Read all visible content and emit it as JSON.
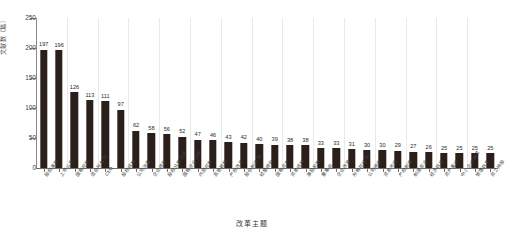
{
  "header": {
    "clipped_line_left": "",
    "clipped_line_right": ""
  },
  "chart_data": {
    "type": "bar",
    "title": "",
    "xlabel": "改革主题",
    "ylabel": "文献数（篇）",
    "ylim": [
      0,
      250
    ],
    "yticks": [
      0,
      50,
      100,
      150,
      200,
      250
    ],
    "grid": "vertical",
    "legend": "none",
    "orientation": "vertical",
    "bar_color": "#2b1f1b",
    "categories": [
      "股权激励",
      "上市公司",
      "国有控股",
      "混合所有制",
      "CEO",
      "股权结构",
      "公司治理",
      "企业绩效",
      "股权分置改革",
      "国有企业改革",
      "内部控制",
      "高管薪酬",
      "产权改革",
      "股份制改革",
      "经营绩效",
      "国有资产",
      "资本结构",
      "激励机制",
      "董事会",
      "企业改革",
      "所有权结构",
      "公司绩效",
      "资本市场",
      "产权制度",
      "制度变迁",
      "经济效益",
      "资产重组",
      "中小企业融资",
      "管理效率",
      "员工持股"
    ],
    "values": [
      197,
      196,
      126,
      113,
      111,
      97,
      62,
      58,
      56,
      52,
      47,
      46,
      43,
      42,
      40,
      39,
      38,
      38,
      33,
      33,
      31,
      30,
      30,
      29,
      27,
      26,
      25,
      25,
      25,
      25
    ],
    "value_labels": [
      "197",
      "196",
      "126",
      "113",
      "111",
      "97",
      "62",
      "58",
      "56",
      "52",
      "47",
      "46",
      "43",
      "42",
      "40",
      "39",
      "38",
      "38",
      "33",
      "33",
      "31",
      "30",
      "30",
      "29",
      "27",
      "26",
      "25",
      "25",
      "25",
      "25"
    ],
    "ytick_labels": [
      "0",
      "50",
      "100",
      "150",
      "200",
      "250"
    ]
  }
}
